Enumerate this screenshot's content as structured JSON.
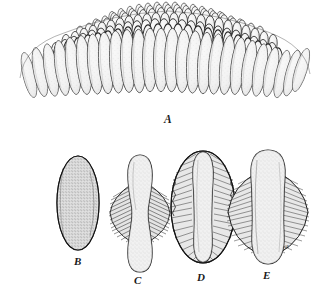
{
  "plate": {
    "title": "Egg mass and egg capsule series",
    "background_color": "#ffffff",
    "ink_color": "#1a1a1a",
    "fill_color": "#efefef",
    "stipple_color": "#8a8a8a",
    "width": 329,
    "height": 296
  },
  "figures": [
    {
      "id": "A",
      "label": "A",
      "caption": "A",
      "description": "egg-mass-cluster",
      "label_x": 168,
      "label_y": 120
    },
    {
      "id": "B",
      "label": "B",
      "caption": "B",
      "description": "egg-capsule-plain-stippled",
      "label_x": 78,
      "label_y": 262
    },
    {
      "id": "C",
      "label": "C",
      "caption": "C",
      "description": "egg-capsule-narrow-flanges",
      "label_x": 137,
      "label_y": 281
    },
    {
      "id": "D",
      "label": "D",
      "caption": "D",
      "description": "egg-capsule-full-ring-flanges",
      "label_x": 200,
      "label_y": 278
    },
    {
      "id": "E",
      "label": "E",
      "caption": "E",
      "description": "egg-capsule-broad-lateral-flanges",
      "label_x": 266,
      "label_y": 276
    }
  ],
  "annotations": [
    {
      "id": "ce",
      "text": "ce",
      "x": 286,
      "y": 247,
      "belongs_to": "E"
    }
  ]
}
